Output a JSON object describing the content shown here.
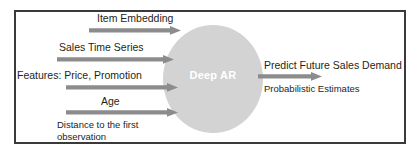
{
  "diagram": {
    "node": {
      "label": "Deep AR",
      "shape": "ellipse",
      "fill": "#d3d3d3",
      "text_color": "#ffffff"
    },
    "frame": {
      "border_color": "#3a3a3c"
    },
    "arrow_color": "#8c8c8c",
    "inputs": [
      {
        "id": "item-embedding",
        "label": "Item Embedding"
      },
      {
        "id": "sales-time-series",
        "label": "Sales Time Series"
      },
      {
        "id": "features-price-promotion",
        "label": "Features: Price, Promotion"
      },
      {
        "id": "age",
        "label": "Age"
      },
      {
        "id": "distance-to-first-observation",
        "label": "Distance to the first observation"
      }
    ],
    "outputs": [
      {
        "id": "predict-future-sales-demand",
        "label": "Predict Future Sales Demand"
      },
      {
        "id": "probabilistic-estimates",
        "label": "Probabilistic Estimates"
      }
    ]
  }
}
